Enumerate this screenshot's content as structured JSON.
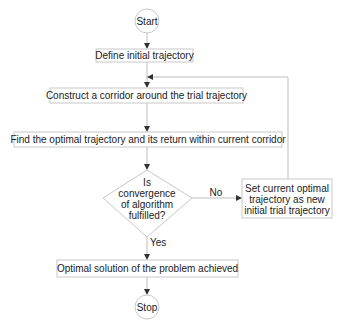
{
  "diagram": {
    "type": "flowchart",
    "colors": {
      "background": "#ffffff",
      "border": "#c8c8c8",
      "connector": "#bdbdbd",
      "arrowhead": "#333333",
      "text": "#222222"
    },
    "nodes": {
      "start": {
        "shape": "circle",
        "label": "Start"
      },
      "define": {
        "shape": "rectangle",
        "label": "Define initial trajectory"
      },
      "construct": {
        "shape": "rectangle",
        "label": "Construct a corridor around the trial trajectory"
      },
      "find": {
        "shape": "rectangle",
        "label": "Find the optimal trajectory and its return within current corridor"
      },
      "decision": {
        "shape": "diamond",
        "lines": [
          "Is",
          "convergence",
          "of algorithm",
          "fulfilled?"
        ]
      },
      "set_current": {
        "shape": "rectangle",
        "lines": [
          "Set current optimal",
          "trajectory as new",
          "initial trial trajectory"
        ]
      },
      "optimal": {
        "shape": "rectangle",
        "label": "Optimal solution of the problem achieved"
      },
      "stop": {
        "shape": "circle",
        "label": "Stop"
      }
    },
    "edges": [
      {
        "from": "start",
        "to": "define",
        "label": ""
      },
      {
        "from": "define",
        "to": "construct",
        "label": ""
      },
      {
        "from": "construct",
        "to": "find",
        "label": ""
      },
      {
        "from": "find",
        "to": "decision",
        "label": ""
      },
      {
        "from": "decision",
        "to": "set_current",
        "label": "No"
      },
      {
        "from": "set_current",
        "to": "construct",
        "label": ""
      },
      {
        "from": "decision",
        "to": "optimal",
        "label": "Yes"
      },
      {
        "from": "optimal",
        "to": "stop",
        "label": ""
      }
    ],
    "edge_labels": {
      "no": "No",
      "yes": "Yes"
    }
  }
}
